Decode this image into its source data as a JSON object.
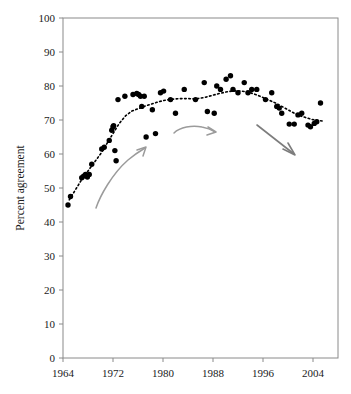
{
  "chart_data": {
    "type": "scatter",
    "title": "",
    "subtitle": "",
    "xlabel": "",
    "ylabel": "Percent agreement",
    "xlim": [
      1963,
      2007
    ],
    "ylim": [
      0,
      100
    ],
    "grid": false,
    "legend": "none",
    "x_ticks": [
      1964,
      1972,
      1980,
      1988,
      1996,
      2004
    ],
    "x_tick_labels": [
      "1964",
      "1972",
      "1980",
      "1988",
      "1996",
      "2004"
    ],
    "y_ticks": [
      0,
      10,
      20,
      30,
      40,
      50,
      60,
      70,
      80,
      90,
      100
    ],
    "y_tick_labels": [
      "0",
      "10",
      "20",
      "30",
      "40",
      "50",
      "60",
      "70",
      "80",
      "90",
      "100"
    ],
    "series": [
      {
        "name": "Percent agreement",
        "marker": "filled-circle",
        "color": "#000000",
        "points": [
          [
            1964.8,
            45.0
          ],
          [
            1965.2,
            47.5
          ],
          [
            1967.0,
            53.0
          ],
          [
            1967.3,
            53.5
          ],
          [
            1967.6,
            54.0
          ],
          [
            1967.9,
            53.2
          ],
          [
            1968.2,
            54.0
          ],
          [
            1968.6,
            57.0
          ],
          [
            1970.2,
            61.5
          ],
          [
            1970.6,
            62.0
          ],
          [
            1971.4,
            64.0
          ],
          [
            1971.8,
            67.0
          ],
          [
            1972.0,
            68.0
          ],
          [
            1972.1,
            68.3
          ],
          [
            1972.3,
            61.0
          ],
          [
            1972.5,
            58.0
          ],
          [
            1972.8,
            76.0
          ],
          [
            1973.9,
            77.0
          ],
          [
            1975.2,
            77.5
          ],
          [
            1975.8,
            77.8
          ],
          [
            1976.1,
            77.5
          ],
          [
            1976.4,
            77.0
          ],
          [
            1976.6,
            74.0
          ],
          [
            1977.0,
            77.0
          ],
          [
            1977.3,
            65.0
          ],
          [
            1978.3,
            73.0
          ],
          [
            1978.8,
            66.0
          ],
          [
            1979.6,
            78.0
          ],
          [
            1980.1,
            78.5
          ],
          [
            1981.2,
            76.0
          ],
          [
            1982.0,
            72.0
          ],
          [
            1983.4,
            79.0
          ],
          [
            1985.2,
            76.0
          ],
          [
            1986.6,
            81.0
          ],
          [
            1987.1,
            72.5
          ],
          [
            1988.2,
            72.0
          ],
          [
            1988.6,
            80.0
          ],
          [
            1989.2,
            79.0
          ],
          [
            1990.1,
            82.0
          ],
          [
            1990.8,
            83.0
          ],
          [
            1991.2,
            79.0
          ],
          [
            1992.0,
            78.0
          ],
          [
            1993.0,
            81.0
          ],
          [
            1993.6,
            78.0
          ],
          [
            1994.2,
            79.0
          ],
          [
            1995.0,
            79.0
          ],
          [
            1996.4,
            76.0
          ],
          [
            1997.4,
            78.0
          ],
          [
            1998.2,
            74.0
          ],
          [
            1998.6,
            73.5
          ],
          [
            1999.0,
            72.0
          ],
          [
            2000.2,
            68.8
          ],
          [
            2001.0,
            68.8
          ],
          [
            2001.6,
            71.5
          ],
          [
            2002.2,
            72.0
          ],
          [
            2003.2,
            68.5
          ],
          [
            2003.6,
            68.0
          ],
          [
            2004.2,
            69.0
          ],
          [
            2004.6,
            69.5
          ],
          [
            2005.2,
            75.0
          ]
        ]
      }
    ],
    "trend_line": {
      "name": "smoothed trend",
      "style": "dotted",
      "color": "#000000",
      "points": [
        [
          1965.0,
          46.5
        ],
        [
          1966.0,
          49.5
        ],
        [
          1967.0,
          52.5
        ],
        [
          1968.0,
          55.0
        ],
        [
          1969.0,
          57.5
        ],
        [
          1970.0,
          60.0
        ],
        [
          1971.0,
          63.0
        ],
        [
          1972.0,
          66.0
        ],
        [
          1973.0,
          69.0
        ],
        [
          1974.0,
          71.2
        ],
        [
          1975.0,
          72.6
        ],
        [
          1976.0,
          73.3
        ],
        [
          1977.0,
          74.0
        ],
        [
          1978.0,
          74.6
        ],
        [
          1979.0,
          75.2
        ],
        [
          1980.0,
          75.7
        ],
        [
          1981.0,
          76.0
        ],
        [
          1982.0,
          76.2
        ],
        [
          1983.0,
          76.3
        ],
        [
          1984.0,
          76.3
        ],
        [
          1985.0,
          76.2
        ],
        [
          1986.0,
          76.4
        ],
        [
          1987.0,
          76.8
        ],
        [
          1988.0,
          77.3
        ],
        [
          1989.0,
          77.8
        ],
        [
          1990.0,
          78.2
        ],
        [
          1991.0,
          78.5
        ],
        [
          1992.0,
          78.6
        ],
        [
          1993.0,
          78.4
        ],
        [
          1994.0,
          78.0
        ],
        [
          1995.0,
          77.4
        ],
        [
          1996.0,
          76.6
        ],
        [
          1997.0,
          75.8
        ],
        [
          1998.0,
          75.0
        ],
        [
          1999.0,
          74.0
        ],
        [
          2000.0,
          73.0
        ],
        [
          2001.0,
          72.0
        ],
        [
          2002.0,
          71.2
        ],
        [
          2003.0,
          70.6
        ],
        [
          2004.0,
          70.1
        ],
        [
          2005.0,
          69.8
        ],
        [
          2005.6,
          69.7
        ]
      ]
    },
    "annotations": [
      {
        "name": "rising-phase-arrow",
        "shape": "curved-arrow",
        "direction": "up-right",
        "color": "#9b9b9b",
        "from": [
          1969.2,
          45.0
        ],
        "to": [
          1977.2,
          62.5
        ]
      },
      {
        "name": "plateau-arrow",
        "shape": "curved-arrow",
        "direction": "right",
        "color": "#9b9b9b",
        "from": [
          1981.0,
          62.0
        ],
        "to": [
          1990.0,
          63.5
        ]
      },
      {
        "name": "decline-arrow",
        "shape": "straight-arrow",
        "direction": "down-right",
        "color": "#7d7d7d",
        "from": [
          1995.0,
          68.0
        ],
        "to": [
          2000.0,
          57.0
        ]
      }
    ]
  }
}
